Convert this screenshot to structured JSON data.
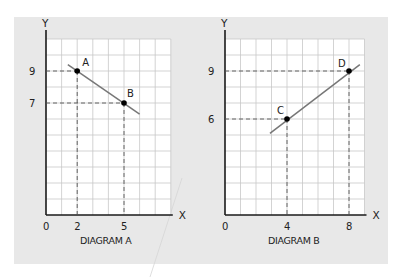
{
  "colors": {
    "panel": "#e8e8e8",
    "grid_bg": "#ffffff",
    "grid_line": "#c8c8c8",
    "axis": "#1a1a1a",
    "curve": "#777777",
    "dash": "#555555",
    "point": "#000000",
    "text": "#222222"
  },
  "chart_data": [
    {
      "type": "line",
      "title": "DIAGRAM A",
      "xlabel": "X",
      "ylabel": "Y",
      "origin_label": "0",
      "x_ticks": [
        2,
        5
      ],
      "y_ticks": [
        9,
        7
      ],
      "grid": true,
      "grid_cols": 8,
      "grid_rows": 11,
      "points": [
        {
          "label": "A",
          "x": 2,
          "y": 9
        },
        {
          "label": "B",
          "x": 5,
          "y": 7
        }
      ],
      "line_extent": {
        "x_start": 1.4,
        "y_start": 9.4,
        "x_end": 6.0,
        "y_end": 6.3
      },
      "slope": -0.667,
      "dashed_guides": true
    },
    {
      "type": "line",
      "title": "DIAGRAM B",
      "xlabel": "X",
      "ylabel": "Y",
      "origin_label": "0",
      "x_ticks": [
        4,
        8
      ],
      "y_ticks": [
        9,
        6
      ],
      "grid": true,
      "grid_cols": 9,
      "grid_rows": 11,
      "points": [
        {
          "label": "C",
          "x": 4,
          "y": 6
        },
        {
          "label": "D",
          "x": 8,
          "y": 9
        }
      ],
      "line_extent": {
        "x_start": 2.9,
        "y_start": 5.1,
        "x_end": 8.7,
        "y_end": 9.4
      },
      "slope": 0.75,
      "dashed_guides": true
    }
  ],
  "layout": {
    "panel": {
      "x": 14,
      "y": 17,
      "w": 374,
      "h": 247
    },
    "diagrams": [
      {
        "ox": 46,
        "oy": 215,
        "ux": 15.6,
        "uy": 16,
        "grid_top": 39
      },
      {
        "ox": 225,
        "oy": 215,
        "ux": 15.5,
        "uy": 16,
        "grid_top": 39
      }
    ]
  }
}
